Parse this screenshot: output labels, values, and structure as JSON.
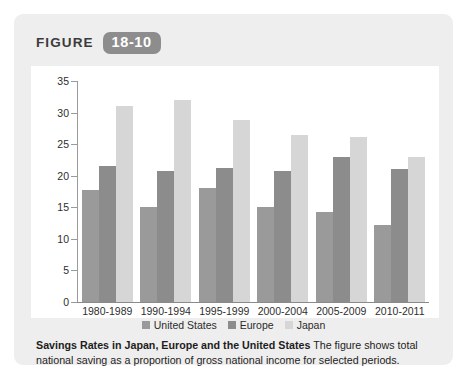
{
  "header": {
    "label": "FIGURE",
    "number": "18-10"
  },
  "caption": {
    "title": "Savings Rates in Japan, Europe and the United States",
    "body": " The figure shows total national saving as a proportion of gross national income for selected periods."
  },
  "colors": {
    "card_background": "#eeeeee",
    "plot_background": "#ffffff",
    "badge": "#8d8d8d",
    "united_states": "#9a9a9a",
    "europe": "#8c8c8c",
    "japan": "#d6d6d6",
    "axis": "#9a9a9a"
  },
  "chart_data": {
    "type": "bar",
    "title": "Savings Rates in Japan, Europe and the United States",
    "xlabel": "",
    "ylabel": "",
    "ylim": [
      0,
      35
    ],
    "yticks": [
      0,
      5,
      10,
      15,
      20,
      25,
      30,
      35
    ],
    "grid": false,
    "legend_position": "bottom",
    "categories": [
      "1980-1989",
      "1990-1994",
      "1995-1999",
      "2000-2004",
      "2005-2009",
      "2010-2011"
    ],
    "series": [
      {
        "name": "United States",
        "values": [
          17.8,
          15.0,
          18.0,
          15.0,
          14.2,
          12.2
        ]
      },
      {
        "name": "Europe",
        "values": [
          21.5,
          20.8,
          21.3,
          20.7,
          23.0,
          21.0
        ]
      },
      {
        "name": "Japan",
        "values": [
          31.0,
          32.0,
          28.8,
          26.5,
          26.2,
          23.0
        ]
      }
    ]
  }
}
